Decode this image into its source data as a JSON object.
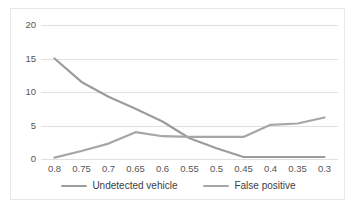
{
  "chart_data": {
    "type": "line",
    "title": "",
    "xlabel": "",
    "ylabel": "",
    "categories": [
      "0.8",
      "0.75",
      "0.7",
      "0.65",
      "0.6",
      "0.55",
      "0.5",
      "0.45",
      "0.4",
      "0.35",
      "0.3"
    ],
    "yticks": [
      0,
      5,
      10,
      15,
      20
    ],
    "ylim": [
      0,
      20
    ],
    "grid": true,
    "legend_position": "bottom",
    "series": [
      {
        "name": "Undetected vehicle",
        "color": "#9c9c9c",
        "values": [
          15.0,
          11.5,
          9.3,
          7.5,
          5.6,
          3.1,
          1.6,
          0.3,
          0.3,
          0.3,
          0.3
        ]
      },
      {
        "name": "False positive",
        "color": "#a6a6a6",
        "values": [
          0.2,
          1.2,
          2.3,
          4.0,
          3.4,
          3.3,
          3.3,
          3.3,
          5.1,
          5.3,
          6.2
        ]
      }
    ]
  },
  "legend": {
    "items": [
      {
        "label": "Undetected vehicle",
        "color": "#9c9c9c"
      },
      {
        "label": "False positive",
        "color": "#a6a6a6"
      }
    ]
  },
  "axis": {
    "y_labels": [
      "20",
      "15",
      "10",
      "5",
      "0"
    ],
    "x_labels": [
      "0.8",
      "0.75",
      "0.7",
      "0.65",
      "0.6",
      "0.55",
      "0.5",
      "0.45",
      "0.4",
      "0.35",
      "0.3"
    ]
  },
  "colors": {
    "gridline": "#e0e0e0",
    "border": "#e8e8e8",
    "tick_text": "#555555",
    "legend_text": "#3d3d3d",
    "background": "#ffffff"
  }
}
